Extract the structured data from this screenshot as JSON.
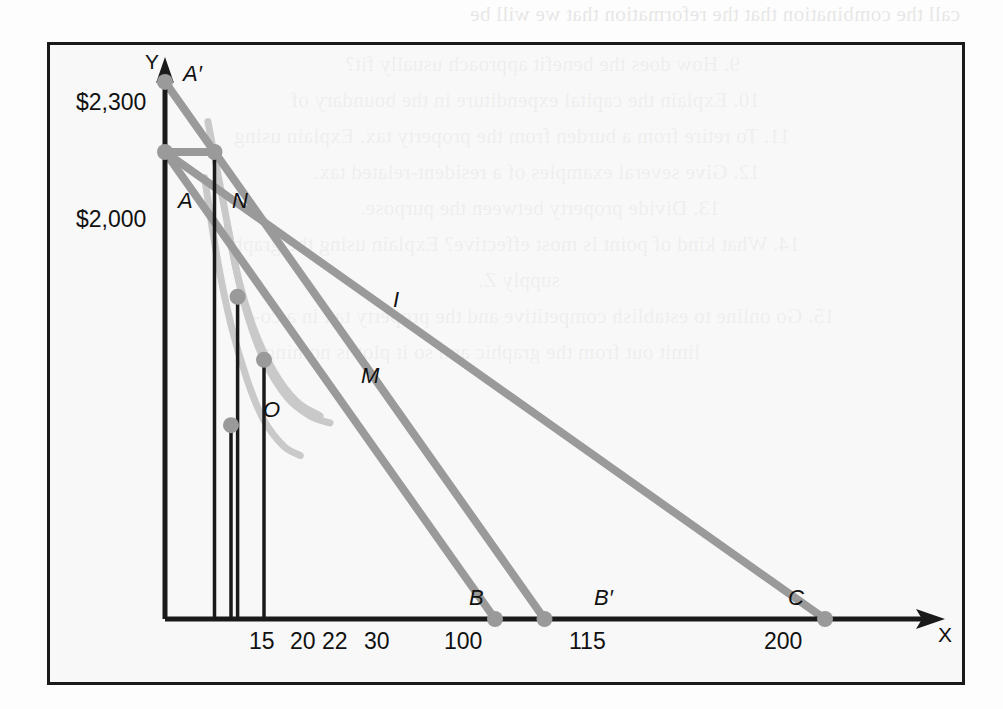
{
  "figure": {
    "axes": {
      "y_axis_label": "Y",
      "x_axis_label": "X"
    },
    "y_value_labels": [
      {
        "text": "$2,300",
        "value": 2300
      },
      {
        "text": "$2,000",
        "value": 2000
      }
    ],
    "x_tick_labels": [
      "15",
      "20",
      "22",
      "30",
      "100",
      "115",
      "200"
    ],
    "point_labels": [
      "A′",
      "A",
      "N",
      "I",
      "M",
      "O",
      "B",
      "B′",
      "C"
    ],
    "colors": {
      "axis": "#1a1a1a",
      "border": "#1a1a1a",
      "budget_line": "#9a9a9a",
      "indifference_curve": "#c9c9c9",
      "point_marker": "#9a9a9a",
      "page_background": "#fdfdfd",
      "figure_background": "#f4f4f4"
    }
  },
  "chart_data": {
    "type": "line",
    "title": "",
    "xlabel": "X",
    "ylabel": "Y",
    "xlim": [
      0,
      230
    ],
    "ylim": [
      0,
      2500
    ],
    "grid": false,
    "legend": "none",
    "x_ticks": [
      15,
      20,
      22,
      30,
      100,
      115,
      200
    ],
    "x_tick_labels": [
      "15",
      "20",
      "22",
      "30",
      "100",
      "115",
      "200"
    ],
    "y_ticks": [
      2000,
      2300
    ],
    "y_tick_labels": [
      "$2,000",
      "$2,300"
    ],
    "points": [
      {
        "name": "A′",
        "x": 0,
        "y": 2300,
        "label_dx": 18,
        "label_dy": -26
      },
      {
        "name": "A",
        "x": 0,
        "y": 2000,
        "label_dx": 14,
        "label_dy": -30
      },
      {
        "name": "N",
        "x": 15,
        "y": 2000,
        "label_dx": -26,
        "label_dy": -30
      },
      {
        "name": "I",
        "x": 22,
        "y": 1380,
        "label_dx": 16,
        "label_dy": -22
      },
      {
        "name": "M",
        "x": 30,
        "y": 1110,
        "label_dx": -20,
        "label_dy": 12
      },
      {
        "name": "O",
        "x": 20,
        "y": 830,
        "label_dx": -28,
        "label_dy": -8
      },
      {
        "name": "B",
        "x": 100,
        "y": 0,
        "label_dx": 6,
        "label_dy": -32
      },
      {
        "name": "B′",
        "x": 115,
        "y": 0,
        "label_dx": 6,
        "label_dy": -32
      },
      {
        "name": "C",
        "x": 200,
        "y": 0,
        "label_dx": 4,
        "label_dy": -32
      }
    ],
    "series": [
      {
        "name": "budget-line-A-B",
        "kind": "budget-line",
        "color": "#9a9a9a",
        "x": [
          0,
          100
        ],
        "y": [
          2000,
          0
        ]
      },
      {
        "name": "budget-line-A-C",
        "kind": "budget-line",
        "color": "#9a9a9a",
        "x": [
          0,
          200
        ],
        "y": [
          2000,
          0
        ]
      },
      {
        "name": "budget-line-Aprime-Bprime",
        "kind": "budget-line",
        "color": "#9a9a9a",
        "x": [
          0,
          115
        ],
        "y": [
          2300,
          0
        ]
      },
      {
        "name": "indifference-curve-upper",
        "kind": "indifference-curve",
        "color": "#c9c9c9",
        "x": [
          13,
          18,
          22,
          27,
          33,
          40,
          47
        ],
        "y": [
          2130,
          1760,
          1470,
          1240,
          1060,
          930,
          870
        ]
      },
      {
        "name": "indifference-curve-lower",
        "kind": "indifference-curve",
        "color": "#c9c9c9",
        "x": [
          12,
          16,
          20,
          25,
          30,
          36,
          41
        ],
        "y": [
          1890,
          1530,
          1260,
          1020,
          850,
          740,
          700
        ]
      },
      {
        "name": "indifference-curve-tangent-M",
        "kind": "indifference-curve",
        "color": "#c9c9c9",
        "x": [
          19,
          24,
          30,
          37,
          44,
          50
        ],
        "y": [
          1680,
          1350,
          1110,
          950,
          870,
          840
        ]
      }
    ],
    "drop_lines": [
      {
        "name": "drop-line-15",
        "x": 15,
        "y_top": 2000
      },
      {
        "name": "drop-line-20",
        "x": 20,
        "y_top": 830
      },
      {
        "name": "drop-line-22",
        "x": 22,
        "y_top": 1380
      },
      {
        "name": "drop-line-30",
        "x": 30,
        "y_top": 1110
      }
    ],
    "connector_lines": [
      {
        "name": "connector-A-to-N",
        "x": [
          0,
          15
        ],
        "y": [
          2000,
          2000
        ]
      }
    ]
  },
  "background_text": {
    "note": "faint mirrored bleed-through from reverse side of scanned page",
    "lines": [
      "call the combination that the reformation that we will be",
      "9.  How does the benefit approach usually fit?",
      "10.  Explain the capital expenditure in the boundary of",
      "11.  To retire from a burden from the property tax. Explain using",
      "12.  Give several examples of a resident-related tax.",
      "13.  Divide property between the purpose.",
      "14.  What kind of point is most effective? Explain using the graph",
      "supply Z.",
      "15.  Go online to establish competitive and the property tax in a co-",
      "  limit out from the graphic and so it plot is nothing."
    ]
  }
}
